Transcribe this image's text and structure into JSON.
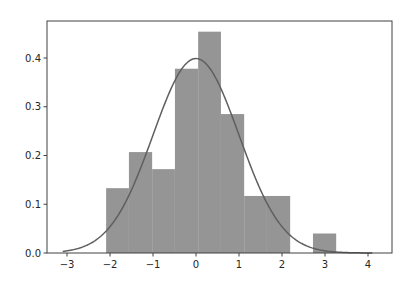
{
  "chart_data": {
    "type": "bar",
    "subtype": "histogram_with_density_curve",
    "title": "",
    "xlabel": "",
    "ylabel": "",
    "xlim": [
      -3.4,
      4.5
    ],
    "ylim": [
      0.0,
      0.475
    ],
    "xticks": [
      -3,
      -2,
      -1,
      0,
      1,
      2,
      3,
      4
    ],
    "xtick_labels": [
      "−3",
      "−2",
      "−1",
      "0",
      "1",
      "2",
      "3",
      "4"
    ],
    "yticks": [
      0.0,
      0.1,
      0.2,
      0.3,
      0.4
    ],
    "ytick_labels": [
      "0.0",
      "0.1",
      "0.2",
      "0.3",
      "0.4"
    ],
    "grid": false,
    "legend": null,
    "bin_edges": [
      -2.09,
      -1.56,
      -1.02,
      -0.49,
      0.05,
      0.58,
      1.12,
      1.65,
      2.19,
      2.72,
      3.26
    ],
    "values": [
      0.133,
      0.207,
      0.172,
      0.378,
      0.454,
      0.285,
      0.117,
      0.117,
      0.0,
      0.04
    ],
    "bar_color": "#959595",
    "curve": {
      "type": "normal_pdf",
      "mean": 0.0,
      "std": 1.0,
      "x_range": [
        -3.1,
        4.1
      ],
      "color": "#5f5f5f"
    }
  },
  "colors": {
    "axis": "#404040",
    "bar": "#959595",
    "curve": "#5f5f5f",
    "text": "#262626"
  }
}
